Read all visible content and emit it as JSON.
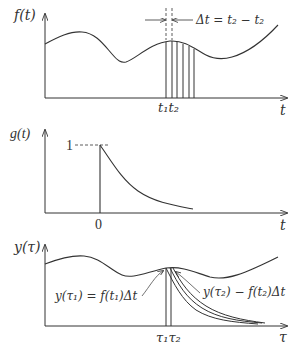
{
  "panels": [
    {
      "name": "f-panel",
      "y_label": "f(t)",
      "x_label": "t",
      "tick_labels": [
        "t₁t₂"
      ],
      "annotation": "Δt = t₂ − t₂"
    },
    {
      "name": "g-panel",
      "y_label": "g(t)",
      "x_label": "t",
      "tick_labels": [
        "0"
      ],
      "y_tick": "1"
    },
    {
      "name": "y-panel",
      "y_label": "y(τ)",
      "x_label": "τ",
      "tick_labels": [
        "τ₁τ₂"
      ],
      "annotation_left": "y(τ₁) = f(t₁)Δt",
      "annotation_right": "y(τ₂) − f(t₂)Δt"
    }
  ],
  "colors": {
    "stroke": "#333333",
    "background": "#ffffff"
  }
}
